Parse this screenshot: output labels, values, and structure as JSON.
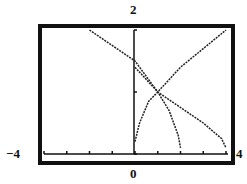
{
  "window": {
    "ymax_label": "2",
    "ymin_label": "0",
    "xmin_label": "−4",
    "xmax_label": "4"
  },
  "chart_data": {
    "type": "line",
    "title": "",
    "xlabel": "",
    "ylabel": "",
    "xlim": [
      -4,
      4
    ],
    "ylim": [
      0,
      2
    ],
    "x_ticks": [
      -4,
      -3,
      -2,
      -1,
      0,
      1,
      2,
      3,
      4
    ],
    "y_ticks": [
      0,
      1,
      2
    ],
    "grid": false,
    "legend": null,
    "series": [
      {
        "name": "decreasing curve (long)",
        "points": [
          [
            -2.0,
            2.0
          ],
          [
            0.0,
            1.5
          ],
          [
            1.0,
            1.0
          ],
          [
            2.0,
            0.75
          ],
          [
            3.0,
            0.5
          ],
          [
            3.8,
            0.25
          ],
          [
            4.0,
            0.1
          ]
        ]
      },
      {
        "name": "decreasing curve (short)",
        "points": [
          [
            0.0,
            1.4
          ],
          [
            0.5,
            1.2
          ],
          [
            1.0,
            1.0
          ],
          [
            1.5,
            0.7
          ],
          [
            1.9,
            0.3
          ],
          [
            2.0,
            0.1
          ]
        ]
      },
      {
        "name": "increasing curve",
        "points": [
          [
            0.0,
            0.2
          ],
          [
            0.2,
            0.5
          ],
          [
            0.6,
            0.85
          ],
          [
            1.0,
            1.0
          ],
          [
            2.0,
            1.4
          ],
          [
            3.0,
            1.7
          ],
          [
            4.0,
            2.0
          ]
        ]
      }
    ]
  }
}
